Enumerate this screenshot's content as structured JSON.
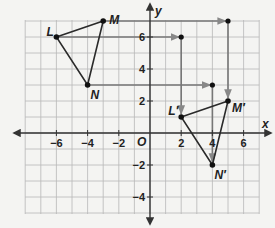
{
  "graph": {
    "x_axis_label": "x",
    "y_axis_label": "y",
    "origin_label": "O",
    "x_ticks": [
      {
        "value": -6,
        "label": "−6"
      },
      {
        "value": -4,
        "label": "−4"
      },
      {
        "value": -2,
        "label": "−2"
      },
      {
        "value": 2,
        "label": "2"
      },
      {
        "value": 4,
        "label": "4"
      },
      {
        "value": 6,
        "label": "6"
      }
    ],
    "y_ticks": [
      {
        "value": 6,
        "label": "6"
      },
      {
        "value": 4,
        "label": "4"
      },
      {
        "value": 2,
        "label": "2"
      },
      {
        "value": -2,
        "label": "−2"
      },
      {
        "value": -4,
        "label": "−4"
      }
    ],
    "grid": {
      "x_min": -8,
      "x_max": 7,
      "y_min": -5,
      "y_max": 7
    },
    "original_triangle": {
      "name": "LMN",
      "vertices": [
        {
          "label": "L",
          "x": -6,
          "y": 6
        },
        {
          "label": "M",
          "x": -3,
          "y": 7
        },
        {
          "label": "N",
          "x": -4,
          "y": 3
        }
      ]
    },
    "image_triangle": {
      "name": "L'M'N'",
      "vertices": [
        {
          "label": "L′",
          "x": 2,
          "y": 1
        },
        {
          "label": "M′",
          "x": 5,
          "y": 2
        },
        {
          "label": "N′",
          "x": 4,
          "y": -2
        }
      ]
    },
    "translation_paths": [
      {
        "from": "L",
        "corner": {
          "x": 2,
          "y": 6
        },
        "to": "L′"
      },
      {
        "from": "M",
        "corner": {
          "x": 5,
          "y": 7
        },
        "to": "M′"
      },
      {
        "from": "N",
        "corner": {
          "x": 4,
          "y": 3
        },
        "to": "N′"
      }
    ],
    "colors": {
      "grid": "#b8b8b8",
      "axis": "#333333",
      "path": "#777777",
      "triangle": "#2a2a2a",
      "background": "#f4f4f2"
    }
  }
}
